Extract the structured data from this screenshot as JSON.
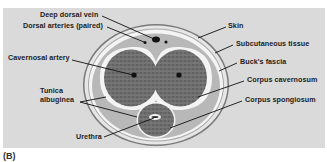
{
  "figure": {
    "panel_label": "(B)",
    "background_color": "#dadada"
  },
  "labels": {
    "deep_dorsal_vein": "Deep dorsal vein",
    "dorsal_arteries": "Dorsal arteries (paired)",
    "cavernosal_artery": "Cavernosal artery",
    "tunica_albuginea_line1": "Tunica",
    "tunica_albuginea_line2": "albuginea",
    "urethra": "Urethra",
    "skin": "Skin",
    "subcutaneous_tissue": "Subcutaneous tissue",
    "bucks_fascia": "Buck's fascia",
    "corpus_cavernosum": "Corpus cavernosum",
    "corpus_spongiosum": "Corpus spongiosum"
  },
  "colors": {
    "skin_line": "#777777",
    "subcutaneous": "#e4e4e4",
    "bucks_fascia": "#f7f7f7",
    "tunica": "#b5b5b5",
    "erectile_tissue": "#6e6e6e",
    "vessel": "#111111"
  }
}
